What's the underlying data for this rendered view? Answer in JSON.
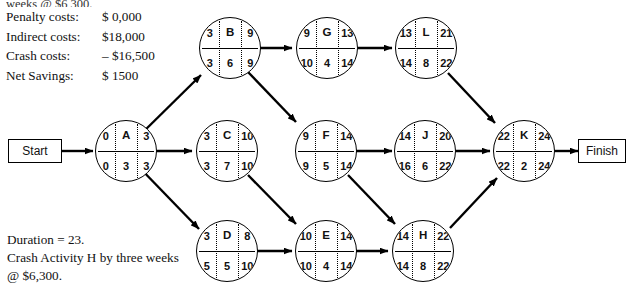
{
  "title_fragment_cut": "weeks @ $6,300.",
  "cost_summary": {
    "rows": [
      {
        "label": "Penalty costs:",
        "value": "$  0,000"
      },
      {
        "label": "Indirect costs:",
        "value": "$18,000"
      },
      {
        "label": "Crash costs:",
        "value": "– $16,500"
      },
      {
        "label": "Net Savings:",
        "value": "$  1500"
      }
    ]
  },
  "notes": {
    "duration": "Duration = 23.",
    "instruction": "Crash Activity H by three weeks @ $6,300."
  },
  "terminals": {
    "start": "Start",
    "finish": "Finish"
  },
  "nodes": [
    {
      "id": "A",
      "name": "A",
      "es": "0",
      "ef": "3",
      "ls": "0",
      "dur": "3",
      "lf": "3"
    },
    {
      "id": "B",
      "name": "B",
      "es": "3",
      "ef": "9",
      "ls": "3",
      "dur": "6",
      "lf": "9"
    },
    {
      "id": "C",
      "name": "C",
      "es": "3",
      "ef": "10",
      "ls": "3",
      "dur": "7",
      "lf": "10"
    },
    {
      "id": "D",
      "name": "D",
      "es": "3",
      "ef": "8",
      "ls": "5",
      "dur": "5",
      "lf": "10"
    },
    {
      "id": "E",
      "name": "E",
      "es": "10",
      "ef": "14",
      "ls": "10",
      "dur": "4",
      "lf": "14"
    },
    {
      "id": "F",
      "name": "F",
      "es": "9",
      "ef": "14",
      "ls": "9",
      "dur": "5",
      "lf": "14"
    },
    {
      "id": "G",
      "name": "G",
      "es": "9",
      "ef": "13",
      "ls": "10",
      "dur": "4",
      "lf": "14"
    },
    {
      "id": "H",
      "name": "H",
      "es": "14",
      "ef": "22",
      "ls": "14",
      "dur": "8",
      "lf": "22"
    },
    {
      "id": "J",
      "name": "J",
      "es": "14",
      "ef": "20",
      "ls": "16",
      "dur": "6",
      "lf": "22"
    },
    {
      "id": "K",
      "name": "K",
      "es": "22",
      "ef": "24",
      "ls": "22",
      "dur": "2",
      "lf": "24"
    },
    {
      "id": "L",
      "name": "L",
      "es": "13",
      "ef": "21",
      "ls": "14",
      "dur": "8",
      "lf": "22"
    }
  ],
  "edges": [
    "Start->A",
    "A->B",
    "A->C",
    "A->D",
    "B->G",
    "B->F",
    "C->E",
    "D->E",
    "G->L",
    "F->J",
    "F->H",
    "E->H",
    "L->K",
    "J->K",
    "H->K",
    "K->Finish"
  ],
  "colors": {
    "stroke": "#000000",
    "background": "#ffffff",
    "text": "#111111"
  }
}
